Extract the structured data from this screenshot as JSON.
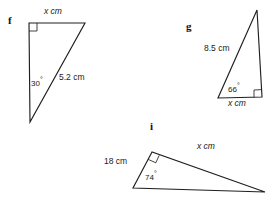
{
  "figure": {
    "background_color": "#ffffff",
    "stroke_color": "#231f20",
    "text_color": "#1a1a1a",
    "width": 272,
    "height": 202,
    "parts": [
      {
        "id": "f",
        "letter": "f",
        "letter_pos": [
          8,
          16
        ],
        "vertices": {
          "top_left": [
            29,
            23
          ],
          "top_right": [
            85,
            23
          ],
          "bottom": [
            30,
            122
          ]
        },
        "right_angle_at": "top_left",
        "labels": {
          "top_side": "x cm",
          "top_side_pos": [
            44,
            8
          ],
          "angle": "30",
          "angle_pos": [
            33,
            79
          ],
          "hypotenuse": "5.2 cm",
          "hypotenuse_pos": [
            59,
            76
          ]
        }
      },
      {
        "id": "g",
        "letter": "g",
        "letter_pos": [
          186,
          22
        ],
        "vertices": {
          "apex": [
            257,
            10
          ],
          "bottom_right": [
            262,
            97
          ],
          "bottom_left": [
            218,
            98
          ]
        },
        "right_angle_at": "bottom_right",
        "labels": {
          "hypotenuse": "8.5 cm",
          "hypotenuse_pos": [
            206,
            47
          ],
          "angle": "66",
          "angle_pos": [
            229,
            84
          ],
          "base_side": "x cm",
          "base_side_pos": [
            228,
            99
          ]
        }
      },
      {
        "id": "i",
        "letter": "i",
        "letter_pos": [
          150,
          122
        ],
        "vertices": {
          "right_angle": [
            152,
            152
          ],
          "bottom_left": [
            133,
            188
          ],
          "right": [
            265,
            192
          ]
        },
        "right_angle_at": "right_angle",
        "labels": {
          "left_side": "18 cm",
          "left_side_pos": [
            106,
            159
          ],
          "angle": "74",
          "angle_pos": [
            146,
            172
          ],
          "hypotenuse": "x cm",
          "hypotenuse_pos": [
            198,
            144
          ]
        }
      }
    ]
  }
}
